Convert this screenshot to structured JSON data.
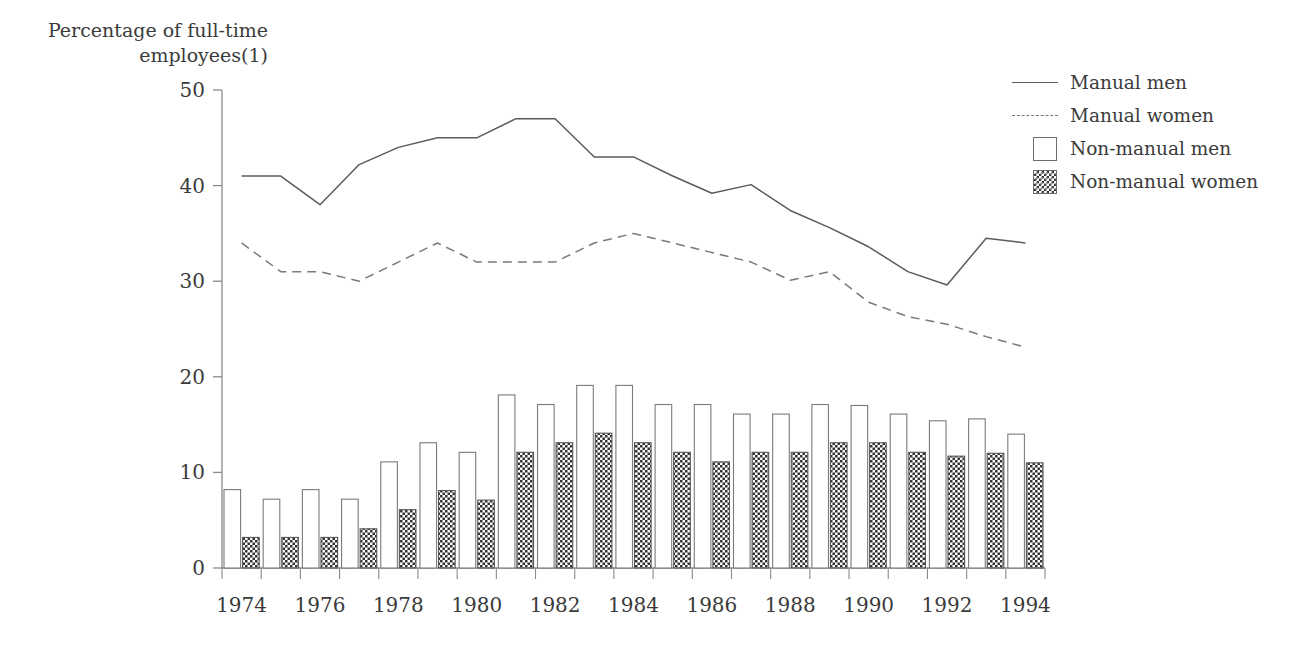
{
  "axis_title": "Percentage of full-time\nemployees(1)",
  "legend": {
    "items": [
      {
        "label": "Manual men",
        "key": "solid-line"
      },
      {
        "label": "Manual women",
        "key": "dashed-line"
      },
      {
        "label": "Non-manual men",
        "key": "open-square"
      },
      {
        "label": "Non-manual women",
        "key": "checkered-square"
      }
    ]
  },
  "chart_data": {
    "type": "bar",
    "title": "",
    "xlabel": "",
    "ylabel": "Percentage of full-time employees(1)",
    "ylim": [
      0,
      50
    ],
    "yticks": [
      0,
      10,
      20,
      30,
      40,
      50
    ],
    "xlim": [
      1974,
      1994
    ],
    "xticks": [
      1974,
      1976,
      1978,
      1980,
      1982,
      1984,
      1986,
      1988,
      1990,
      1992,
      1994
    ],
    "x": [
      1974,
      1975,
      1976,
      1977,
      1978,
      1979,
      1980,
      1981,
      1982,
      1983,
      1984,
      1985,
      1986,
      1987,
      1988,
      1989,
      1990,
      1991,
      1992,
      1993,
      1994
    ],
    "grid": false,
    "legend_position": "right",
    "series": [
      {
        "name": "Manual men",
        "type": "line",
        "style": "solid",
        "color": "#5b5b5b",
        "values": [
          41,
          41,
          38,
          42.2,
          44,
          45,
          45,
          47,
          47,
          43,
          43,
          41,
          39.2,
          40.1,
          37.4,
          35.6,
          33.6,
          31,
          29.6,
          34.5,
          34
        ]
      },
      {
        "name": "Manual women",
        "type": "line",
        "style": "dashed",
        "color": "#7a7a7a",
        "values": [
          34,
          31,
          31,
          30,
          32,
          34,
          32,
          32,
          32,
          34,
          35,
          34,
          33,
          32,
          30.1,
          31,
          27.8,
          26.3,
          25.5,
          24.2,
          23.1
        ]
      },
      {
        "name": "Non-manual men",
        "type": "bar",
        "fill": "open",
        "values": [
          8.2,
          7.2,
          8.2,
          7.2,
          11.1,
          13.1,
          12.1,
          18.1,
          17.1,
          19.1,
          19.1,
          17.1,
          17.1,
          16.1,
          16.1,
          17.1,
          17,
          16.1,
          15.4,
          15.6,
          14
        ]
      },
      {
        "name": "Non-manual women",
        "type": "bar",
        "fill": "checkered",
        "values": [
          3.2,
          3.2,
          3.2,
          4.1,
          6.1,
          8.1,
          7.1,
          12.1,
          13.1,
          14.1,
          13.1,
          12.1,
          11.1,
          12.1,
          12.1,
          13.1,
          13.1,
          12.1,
          11.7,
          12,
          11
        ]
      }
    ]
  }
}
